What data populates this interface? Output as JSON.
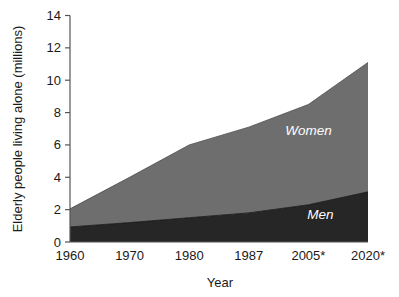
{
  "chart_data": {
    "type": "area",
    "stacked": true,
    "title": "",
    "subtitle": "",
    "xlabel": "Year",
    "ylabel": "Elderly people living alone (millions)",
    "categories": [
      "1960",
      "1970",
      "1980",
      "1987",
      "2005*",
      "2020*"
    ],
    "x_tick_labels": [
      "1960",
      "1970",
      "1980",
      "1987",
      "2005*",
      "2020*"
    ],
    "y_tick_labels": [
      "0",
      "2",
      "4",
      "6",
      "8",
      "10",
      "12",
      "14"
    ],
    "y_ticks": [
      0,
      2,
      4,
      6,
      8,
      10,
      12,
      14
    ],
    "ylim": [
      0,
      14
    ],
    "xlim": [
      0,
      5
    ],
    "grid": false,
    "legend_position": "inline-labels",
    "series": [
      {
        "name": "Men",
        "label": "Men",
        "color": "#262626",
        "values": [
          0.93,
          1.2,
          1.5,
          1.8,
          2.3,
          3.1
        ]
      },
      {
        "name": "Women",
        "label": "Women",
        "color": "#6e6e6e",
        "values": [
          1.12,
          2.8,
          4.5,
          5.3,
          6.2,
          8.0
        ]
      }
    ],
    "cumulative_totals": [
      2.05,
      4.0,
      6.0,
      7.1,
      8.5,
      11.1
    ],
    "annotations": [
      {
        "text": "Women",
        "x_index": 4.0,
        "value": 6.6
      },
      {
        "text": "Men",
        "x_index": 4.2,
        "value": 1.4
      }
    ],
    "footnote_marker": "*"
  },
  "axis": {
    "y_title": "Elderly people living alone (millions)",
    "x_title": "Year"
  },
  "colors": {
    "men": "#262626",
    "women": "#6e6e6e",
    "axis": "#555555",
    "text": "#1a1a1a",
    "series_label_text": "#ffffff",
    "background": "#ffffff"
  }
}
